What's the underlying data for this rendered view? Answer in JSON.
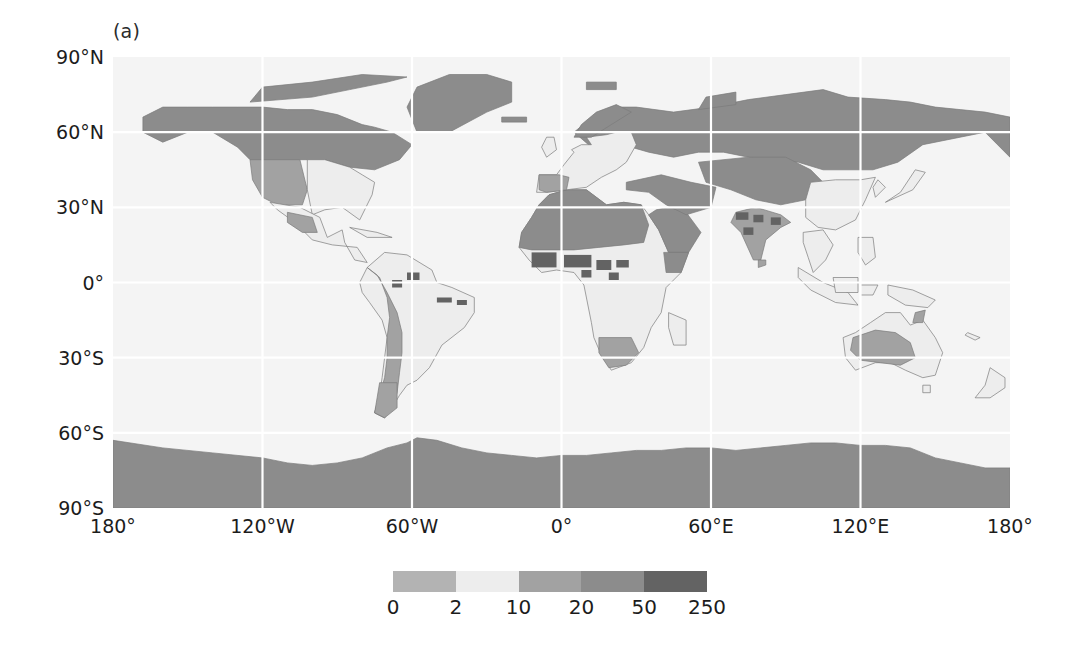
{
  "figure": {
    "panel_label": "(a)",
    "type": "map-figure"
  },
  "axes": {
    "y_ticks": [
      {
        "label": "90°N",
        "value": 90
      },
      {
        "label": "60°N",
        "value": 60
      },
      {
        "label": "30°N",
        "value": 30
      },
      {
        "label": "0°",
        "value": 0
      },
      {
        "label": "30°S",
        "value": -30
      },
      {
        "label": "60°S",
        "value": -60
      },
      {
        "label": "90°S",
        "value": -90
      }
    ],
    "x_ticks": [
      {
        "label": "180°",
        "value": -180
      },
      {
        "label": "120°W",
        "value": -120
      },
      {
        "label": "60°W",
        "value": -60
      },
      {
        "label": "0°",
        "value": 0
      },
      {
        "label": "60°E",
        "value": 60
      },
      {
        "label": "120°E",
        "value": 120
      },
      {
        "label": "180°",
        "value": 180
      }
    ]
  },
  "colorbar": {
    "boundaries": [
      "0",
      "2",
      "10",
      "20",
      "50",
      "250"
    ],
    "band_colors": [
      "#b3b3b3",
      "#ededed",
      "#a2a2a2",
      "#8c8c8c",
      "#636363"
    ],
    "orientation": "horizontal"
  },
  "chart_data": {
    "type": "heatmap",
    "title": "(a)",
    "xlabel": "",
    "ylabel": "",
    "xlim": [
      -180,
      180
    ],
    "ylim": [
      -90,
      90
    ],
    "grid": true,
    "projection": "equirectangular",
    "colorbar_boundaries": [
      0,
      2,
      10,
      20,
      50,
      250
    ],
    "colorbar_colors": [
      "#b3b3b3",
      "#ededed",
      "#a2a2a2",
      "#8c8c8c",
      "#636363"
    ],
    "legend_position": "bottom",
    "x_tick_labels": [
      "180°",
      "120°W",
      "60°W",
      "0°",
      "60°E",
      "120°E",
      "180°"
    ],
    "y_tick_labels": [
      "90°N",
      "60°N",
      "30°N",
      "0°",
      "30°S",
      "60°S",
      "90°S"
    ],
    "ocean_value": "0-2",
    "regions": [
      {
        "name": "Arctic / high-latitude North America",
        "bin": "20-50",
        "color": "#8c8c8c"
      },
      {
        "name": "Greenland",
        "bin": "20-50",
        "color": "#8c8c8c"
      },
      {
        "name": "Northern Eurasia / Siberia",
        "bin": "20-50",
        "color": "#8c8c8c"
      },
      {
        "name": "Western United States",
        "bin": "10-20",
        "color": "#a2a2a2"
      },
      {
        "name": "Eastern United States",
        "bin": "2-10",
        "color": "#ededed"
      },
      {
        "name": "Central America",
        "bin": "2-10",
        "color": "#ededed"
      },
      {
        "name": "Amazon basin",
        "bin": "2-10",
        "color": "#ededed"
      },
      {
        "name": "Andes",
        "bin": "10-20",
        "color": "#a2a2a2"
      },
      {
        "name": "Patagonia",
        "bin": "10-20",
        "color": "#a2a2a2"
      },
      {
        "name": "Sahara / North Africa",
        "bin": "20-50",
        "color": "#8c8c8c"
      },
      {
        "name": "Arabian Peninsula",
        "bin": "20-50",
        "color": "#8c8c8c"
      },
      {
        "name": "Sahel patches",
        "bin": "50-250",
        "color": "#636363"
      },
      {
        "name": "Central / Southern Africa",
        "bin": "2-10",
        "color": "#ededed"
      },
      {
        "name": "Southern Africa interior",
        "bin": "10-20",
        "color": "#a2a2a2"
      },
      {
        "name": "Central Asia / Tibetan Plateau",
        "bin": "20-50",
        "color": "#8c8c8c"
      },
      {
        "name": "India",
        "bin": "10-20",
        "color": "#a2a2a2"
      },
      {
        "name": "Southeast Asia / Indonesia",
        "bin": "2-10",
        "color": "#ededed"
      },
      {
        "name": "Australia interior",
        "bin": "10-20",
        "color": "#a2a2a2"
      },
      {
        "name": "Australia coastal",
        "bin": "2-10",
        "color": "#ededed"
      },
      {
        "name": "Antarctica",
        "bin": "20-50",
        "color": "#8c8c8c"
      },
      {
        "name": "Oceans",
        "bin": "0-2",
        "color": "#f4f4f4"
      }
    ]
  }
}
